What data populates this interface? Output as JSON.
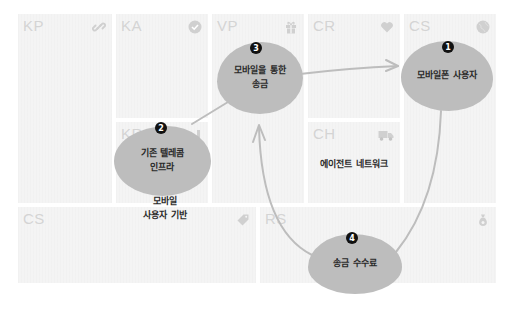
{
  "canvas": {
    "blocks": {
      "kp": {
        "code": "KP",
        "icon": "link-icon"
      },
      "ka": {
        "code": "KA",
        "icon": "check-circle-icon"
      },
      "kr": {
        "code": "KR",
        "icon": "factory-icon"
      },
      "vp": {
        "code": "VP",
        "icon": "gift-icon"
      },
      "cr": {
        "code": "CR",
        "icon": "heart-icon"
      },
      "ch": {
        "code": "CH",
        "icon": "truck-icon"
      },
      "cs": {
        "code": "CS",
        "icon": "globe-icon"
      },
      "c_cost": {
        "code": "CS",
        "icon": "tag-icon"
      },
      "rs": {
        "code": "RS",
        "icon": "money-bag-icon"
      }
    },
    "steps": [
      {
        "number": "1",
        "text": "모바일폰 사용자",
        "block": "CS"
      },
      {
        "number": "2",
        "text_line1": "기존 텔레콤",
        "text_line2": "인프라",
        "block": "KR"
      },
      {
        "number": "3",
        "text_line1": "모바일을 통한",
        "text_line2": "송금",
        "block": "VP"
      },
      {
        "number": "4",
        "text": "송금 수수료",
        "block": "RS"
      }
    ],
    "notes": {
      "kr_note_line1": "모바일",
      "kr_note_line2": "사용자 기반",
      "ch_note": "에이전트 네트워크"
    }
  },
  "colors": {
    "block_bg": "#f4f4f4",
    "block_label": "#d4d4d4",
    "blob": "#bdbdbd",
    "arrow": "#bdbdbd",
    "badge": "#111111"
  }
}
